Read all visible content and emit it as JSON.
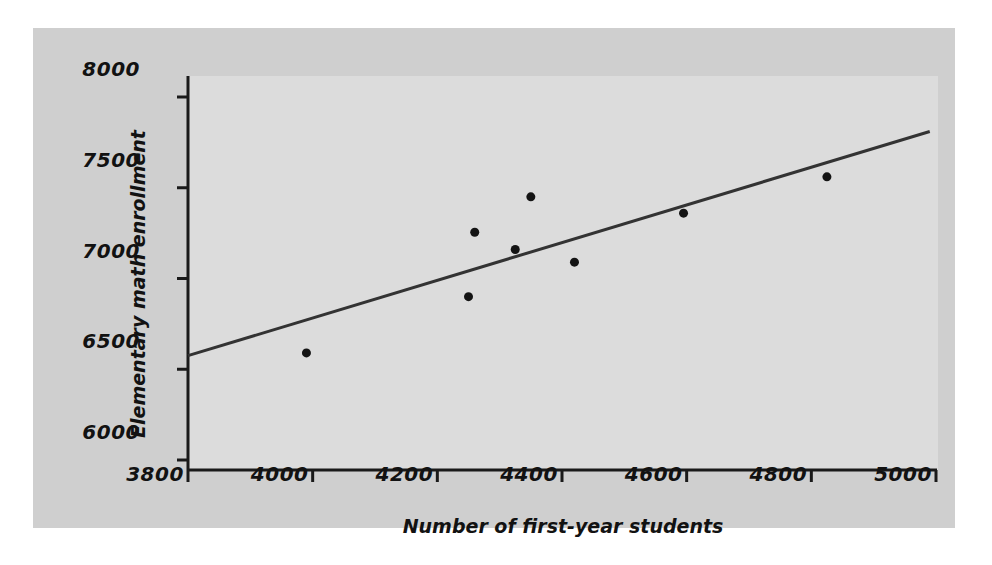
{
  "figure": {
    "background_color": "#ffffff",
    "mat_color": "#cfcfcf",
    "panel_color": "#dcdcdc",
    "axis_color": "#1a1a1a",
    "marker_color": "#141414",
    "line_color": "#333333"
  },
  "chart_data": {
    "type": "scatter",
    "title": "",
    "xlabel": "Number of first-year students",
    "ylabel": "Elementary math enrollment",
    "xlim": [
      3800,
      5000
    ],
    "ylim": [
      6000,
      8000
    ],
    "xticks": [
      3800,
      4000,
      4200,
      4400,
      4600,
      4800,
      5000
    ],
    "xtick_labels": [
      "3800",
      "4000",
      "4200",
      "4400",
      "4600",
      "4800",
      "5000"
    ],
    "yticks": [
      6000,
      6500,
      7000,
      7500,
      8000
    ],
    "ytick_labels": [
      "6000",
      "6500",
      "7000",
      "7500",
      "8000"
    ],
    "grid": false,
    "legend": false,
    "points": [
      {
        "x": 3990,
        "y": 6590
      },
      {
        "x": 4250,
        "y": 6900
      },
      {
        "x": 4260,
        "y": 7255
      },
      {
        "x": 4325,
        "y": 7160
      },
      {
        "x": 4350,
        "y": 7450
      },
      {
        "x": 4420,
        "y": 7090
      },
      {
        "x": 4595,
        "y": 7360
      },
      {
        "x": 4825,
        "y": 7560
      }
    ],
    "marker_size_px": 9,
    "trendline": {
      "kind": "least-squares-fit",
      "x_start": 3800,
      "y_start": 6575,
      "x_end": 4990,
      "y_end": 7810
    }
  }
}
